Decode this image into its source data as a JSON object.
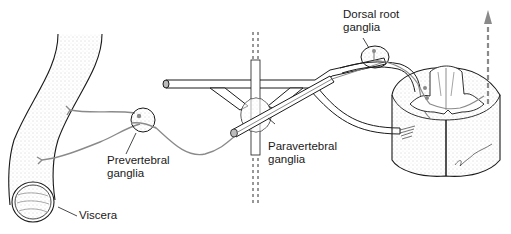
{
  "diagram": {
    "colors": {
      "outline": "#1a1a1a",
      "nerve_fiber": "#8a8a8a",
      "stipple": "#9a9a9a",
      "background": "#ffffff"
    },
    "labels": {
      "dorsal_root_line1": "Dorsal root",
      "dorsal_root_line2": "ganglia",
      "paravertebral_line1": "Paravertebral",
      "paravertebral_line2": "ganglia",
      "prevertebral_line1": "Prevertebral",
      "prevertebral_line2": "ganglia",
      "viscera": "Viscera"
    },
    "structures": [
      "viscera-tube",
      "prevertebral-ganglion",
      "sympathetic-chain",
      "paravertebral-ganglion",
      "spinal-nerve",
      "dorsal-root-ganglion",
      "spinal-cord-section",
      "ascending-pathway-arrow"
    ]
  }
}
